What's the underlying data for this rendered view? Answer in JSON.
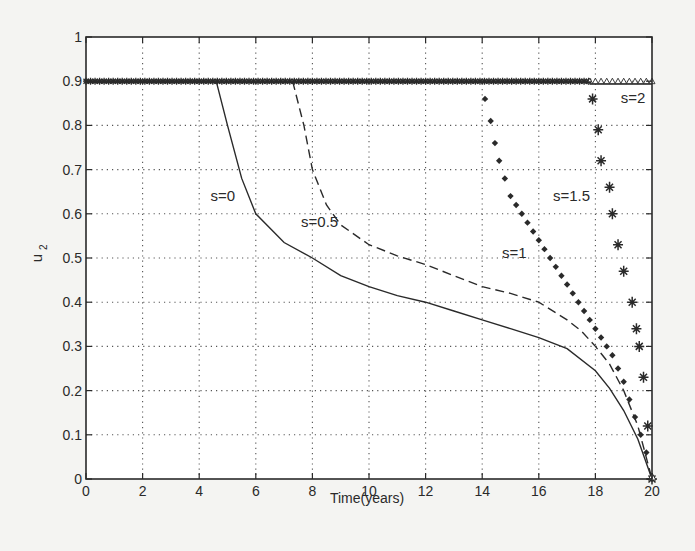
{
  "chart_data": {
    "type": "line",
    "title": "",
    "xlabel": "Time(years)",
    "ylabel": "u2",
    "xlim": [
      0,
      20
    ],
    "ylim": [
      0,
      1
    ],
    "xticks": [
      0,
      2,
      4,
      6,
      8,
      10,
      12,
      14,
      16,
      18,
      20
    ],
    "yticks": [
      0,
      0.1,
      0.2,
      0.3,
      0.4,
      0.5,
      0.6,
      0.7,
      0.8,
      0.9,
      1
    ],
    "ytick_labels": [
      "0",
      "0.1",
      "0.2",
      "0.3",
      "0.4",
      "0.5",
      "0.6",
      "0.7",
      "0.8",
      "0.9",
      "1"
    ],
    "grid": true,
    "legend": "inline annotations",
    "series": [
      {
        "name": "s=0",
        "style": "solid",
        "x": [
          0,
          4.6,
          5.0,
          5.5,
          6,
          7,
          8,
          9,
          10,
          11,
          12,
          13,
          14,
          15,
          16,
          17,
          18,
          18.5,
          19,
          19.5,
          20
        ],
        "y": [
          0.9,
          0.9,
          0.8,
          0.68,
          0.6,
          0.535,
          0.5,
          0.46,
          0.435,
          0.415,
          0.4,
          0.38,
          0.36,
          0.34,
          0.32,
          0.295,
          0.245,
          0.205,
          0.155,
          0.09,
          0
        ]
      },
      {
        "name": "s=0.5",
        "style": "dashed",
        "x": [
          0,
          7.3,
          7.7,
          8,
          8.5,
          9,
          10,
          11,
          12,
          13,
          14,
          15,
          16,
          17,
          17.5,
          18,
          18.5,
          19,
          19.5,
          20
        ],
        "y": [
          0.9,
          0.9,
          0.8,
          0.7,
          0.62,
          0.575,
          0.53,
          0.505,
          0.485,
          0.46,
          0.435,
          0.42,
          0.4,
          0.36,
          0.335,
          0.3,
          0.26,
          0.2,
          0.12,
          0
        ]
      },
      {
        "name": "s=1",
        "style": "diamond-markers",
        "x": [
          0,
          14.05,
          14.1,
          14.3,
          14.45,
          14.6,
          14.8,
          15.0,
          15.2,
          15.4,
          15.6,
          15.8,
          16.0,
          16.2,
          16.4,
          16.6,
          16.8,
          17.0,
          17.2,
          17.4,
          17.6,
          17.8,
          18.0,
          18.2,
          18.4,
          18.6,
          18.8,
          19.0,
          19.2,
          19.4,
          19.6,
          19.8,
          20.0
        ],
        "y": [
          0.9,
          0.9,
          0.86,
          0.81,
          0.76,
          0.72,
          0.68,
          0.64,
          0.62,
          0.6,
          0.58,
          0.56,
          0.54,
          0.52,
          0.5,
          0.48,
          0.46,
          0.44,
          0.42,
          0.4,
          0.38,
          0.36,
          0.34,
          0.32,
          0.3,
          0.28,
          0.25,
          0.22,
          0.18,
          0.14,
          0.1,
          0.06,
          0
        ]
      },
      {
        "name": "s=1.5",
        "style": "star-markers",
        "x": [
          0,
          17.85,
          17.9,
          18.1,
          18.2,
          18.5,
          18.6,
          18.8,
          19.0,
          19.3,
          19.45,
          19.55,
          19.7,
          19.85,
          20.0
        ],
        "y": [
          0.9,
          0.9,
          0.86,
          0.79,
          0.72,
          0.66,
          0.6,
          0.53,
          0.47,
          0.4,
          0.34,
          0.3,
          0.23,
          0.12,
          0
        ]
      },
      {
        "name": "s=2",
        "style": "triangle-markers",
        "x": [
          0,
          17.8,
          20.0,
          20.0
        ],
        "y": [
          0.9,
          0.9,
          0.9,
          0
        ]
      }
    ],
    "annotations": [
      {
        "text": "s=0",
        "x": 4.4,
        "y": 0.63
      },
      {
        "text": "s=0.5",
        "x": 7.6,
        "y": 0.57
      },
      {
        "text": "s=1",
        "x": 14.7,
        "y": 0.5
      },
      {
        "text": "s=1.5",
        "x": 16.5,
        "y": 0.63
      },
      {
        "text": "s=2",
        "x": 18.9,
        "y": 0.85
      }
    ]
  },
  "labels": {
    "xlabel": "Time(years)",
    "ylabel_base": "u",
    "ylabel_sub": "2",
    "s0": "s=0",
    "s05": "s=0.5",
    "s1": "s=1",
    "s15": "s=1.5",
    "s2": "s=2"
  },
  "colors": {
    "background": "#f4f4f2",
    "plot_bg": "#ffffff",
    "line": "#2a2a2a",
    "grid": "#555555"
  }
}
